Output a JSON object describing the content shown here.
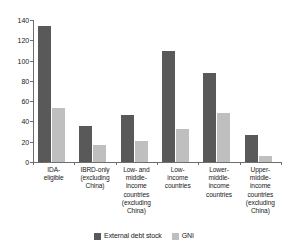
{
  "chart_data": {
    "type": "bar",
    "title": "",
    "subtitle": "",
    "xlabel": "",
    "ylabel": "",
    "ylim": [
      0,
      140
    ],
    "yticks": [
      0,
      20,
      40,
      60,
      80,
      100,
      120,
      140
    ],
    "grid": false,
    "legend_position": "bottom",
    "categories": [
      "IDA-eligible",
      "IBRD-only (excluding China)",
      "Low- and middle-income countries (excluding China)",
      "Low-income countries",
      "Lower-middle-income countries",
      "Upper-middle-income countries (excluding China)"
    ],
    "category_label_lines": [
      [
        "IDA-",
        "eligible"
      ],
      [
        "IBRD-only",
        "(excluding",
        "China)"
      ],
      [
        "Low- and",
        "middle-",
        "income",
        "countries",
        "(excluding",
        "China)"
      ],
      [
        "Low-",
        "income",
        "countries"
      ],
      [
        "Lower-",
        "middle-",
        "income",
        "countries"
      ],
      [
        "Upper-",
        "middle-",
        "income",
        "countries",
        "(excluding",
        "China)"
      ]
    ],
    "series": [
      {
        "name": "External debt stock",
        "color": "#595959",
        "values": [
          134,
          36,
          46,
          109,
          88,
          27
        ]
      },
      {
        "name": "GNI",
        "color": "#bfbfbf",
        "values": [
          53,
          17,
          21,
          33,
          48,
          6
        ]
      }
    ]
  }
}
